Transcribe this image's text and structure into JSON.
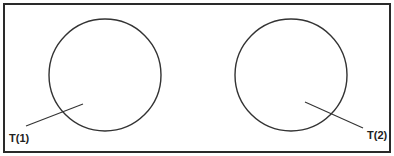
{
  "diagram": {
    "frame": {
      "x": 4,
      "y": 4,
      "width": 386,
      "height": 148,
      "stroke": "#2a2a2a"
    },
    "circles": [
      {
        "id": "T1",
        "cx": 105,
        "cy": 75,
        "r": 56,
        "stroke": "#333333"
      },
      {
        "id": "T2",
        "cx": 291,
        "cy": 75,
        "r": 56,
        "stroke": "#333333"
      }
    ],
    "leaders": [
      {
        "id": "T1",
        "x1": 83,
        "y1": 104,
        "x2": 26,
        "y2": 126
      },
      {
        "id": "T2",
        "x1": 305,
        "y1": 102,
        "x2": 363,
        "y2": 128
      }
    ],
    "labels": {
      "t1": "T(1)",
      "t2": "T(2)"
    }
  }
}
